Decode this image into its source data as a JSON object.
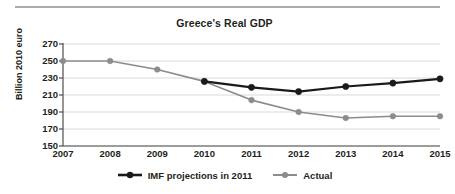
{
  "chart_data": {
    "type": "line",
    "title": "Greece's Real GDP",
    "xlabel": "",
    "ylabel": "Billion 2010 euro",
    "x": [
      2007,
      2008,
      2009,
      2010,
      2011,
      2012,
      2013,
      2014,
      2015
    ],
    "xtick_labels": [
      "2007",
      "2008",
      "2009",
      "2010",
      "2011",
      "2012",
      "2013",
      "2014",
      "2015"
    ],
    "ytick_labels": [
      "270",
      "250",
      "230",
      "210",
      "190",
      "170",
      "150"
    ],
    "yticks": [
      270,
      250,
      230,
      210,
      190,
      170,
      150
    ],
    "ylim": [
      150,
      270
    ],
    "xlim": [
      2007,
      2015
    ],
    "grid": true,
    "grid_axis": "y",
    "legend_position": "bottom-center",
    "series": [
      {
        "name": "IMF projections in 2011",
        "color": "#1a1a1a",
        "marker": "circle",
        "x": [
          2010,
          2011,
          2012,
          2013,
          2014,
          2015
        ],
        "values": [
          226,
          219,
          214,
          220,
          224,
          229
        ]
      },
      {
        "name": "Actual",
        "color": "#8c8c8c",
        "marker": "circle",
        "x": [
          2007,
          2008,
          2009,
          2010,
          2011,
          2012,
          2013,
          2014,
          2015
        ],
        "values": [
          250,
          250,
          240,
          226,
          204,
          190,
          183,
          185,
          185
        ]
      }
    ]
  },
  "legend": {
    "items": [
      {
        "label": "IMF projections in 2011",
        "color": "#1a1a1a"
      },
      {
        "label": "Actual",
        "color": "#8c8c8c"
      }
    ]
  },
  "colors": {
    "rule": "#a9abae",
    "axis": "#4d4d4d",
    "grid": "#d9d9d9",
    "text": "#231f20",
    "projection_series": "#1a1a1a",
    "actual_series": "#8c8c8c",
    "background": "#ffffff"
  }
}
